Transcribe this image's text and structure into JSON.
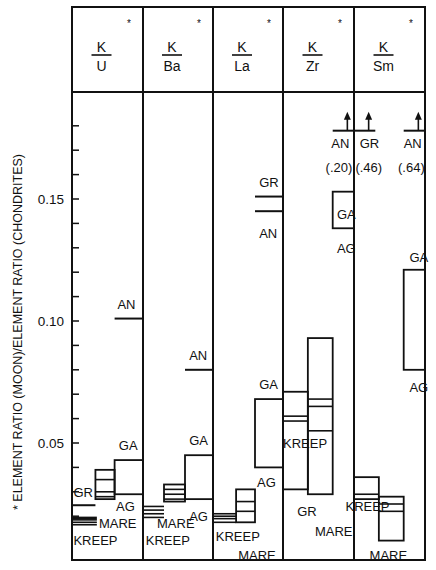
{
  "chart_data": {
    "type": "bar",
    "title": "",
    "ylabel": "* ELEMENT RATIO (MOON)/ELEMENT RATIO (CHONDRITES)",
    "xlabel": "",
    "ylim": [
      0,
      0.19
    ],
    "yticks": [
      {
        "value": 0.05,
        "label": "0.05"
      },
      {
        "value": 0.1,
        "label": "0.10"
      },
      {
        "value": 0.15,
        "label": "0.15"
      }
    ],
    "minor_tick_step": 0.01,
    "grid": false,
    "columns": [
      {
        "num": "K",
        "den": "U",
        "star": "*"
      },
      {
        "num": "K",
        "den": "Ba",
        "star": "*"
      },
      {
        "num": "K",
        "den": "La",
        "star": "*"
      },
      {
        "num": "K",
        "den": "Zr",
        "star": "*"
      },
      {
        "num": "K",
        "den": "Sm",
        "star": "*"
      }
    ],
    "series": [
      {
        "column": 0,
        "name": "KREEP",
        "kind": "band",
        "x": [
          0.0,
          0.35
        ],
        "lines": [
          0.0165,
          0.0175,
          0.0185,
          0.019,
          0.0195
        ]
      },
      {
        "column": 0,
        "name": "GR",
        "kind": "level",
        "x": [
          0.0,
          0.33
        ],
        "value": 0.0245
      },
      {
        "column": 0,
        "name": "MARE",
        "kind": "range",
        "x": [
          0.33,
          0.6
        ],
        "low": 0.027,
        "high": 0.039,
        "lines": [
          0.028,
          0.03,
          0.035
        ]
      },
      {
        "column": 0,
        "name": "AG/GA",
        "kind": "range",
        "x": [
          0.6,
          1.0
        ],
        "low": 0.029,
        "high": 0.043
      },
      {
        "column": 0,
        "name": "AN",
        "kind": "level",
        "x": [
          0.6,
          1.0
        ],
        "value": 0.101
      },
      {
        "column": 1,
        "name": "KREEP",
        "kind": "band",
        "x": [
          0.0,
          0.3
        ],
        "lines": [
          0.0195,
          0.021,
          0.0225,
          0.024
        ]
      },
      {
        "column": 1,
        "name": "MARE",
        "kind": "range",
        "x": [
          0.3,
          0.6
        ],
        "low": 0.026,
        "high": 0.033,
        "lines": [
          0.027,
          0.029,
          0.031
        ]
      },
      {
        "column": 1,
        "name": "AG/GA",
        "kind": "range",
        "x": [
          0.6,
          1.0
        ],
        "low": 0.027,
        "high": 0.045
      },
      {
        "column": 1,
        "name": "AN",
        "kind": "level",
        "x": [
          0.6,
          1.0
        ],
        "value": 0.08
      },
      {
        "column": 2,
        "name": "KREEP",
        "kind": "band",
        "x": [
          0.0,
          0.33
        ],
        "lines": [
          0.0175,
          0.019,
          0.02,
          0.021
        ]
      },
      {
        "column": 2,
        "name": "MARE",
        "kind": "range",
        "x": [
          0.33,
          0.6
        ],
        "low": 0.0175,
        "high": 0.031,
        "lines": [
          0.022,
          0.026
        ]
      },
      {
        "column": 2,
        "name": "AG/GA",
        "kind": "range",
        "x": [
          0.6,
          1.0
        ],
        "low": 0.04,
        "high": 0.068
      },
      {
        "column": 2,
        "name": "GR",
        "kind": "level",
        "x": [
          0.6,
          1.0
        ],
        "value": 0.151
      },
      {
        "column": 2,
        "name": "AN",
        "kind": "level",
        "x": [
          0.6,
          1.0
        ],
        "value": 0.145
      },
      {
        "column": 3,
        "name": "GR",
        "kind": "range",
        "x": [
          0.0,
          0.35
        ],
        "low": 0.031,
        "high": 0.071,
        "lines": [
          0.059,
          0.061
        ]
      },
      {
        "column": 3,
        "name": "KREEP/MARE",
        "kind": "range",
        "x": [
          0.35,
          0.7
        ],
        "low": 0.029,
        "high": 0.093,
        "lines": [
          0.055,
          0.065,
          0.068
        ]
      },
      {
        "column": 3,
        "name": "AG/GA",
        "kind": "range",
        "x": [
          0.7,
          1.0
        ],
        "low": 0.138,
        "high": 0.153
      },
      {
        "column": 3,
        "name": "AN (.20)",
        "kind": "offscale",
        "x": [
          0.7,
          1.0
        ],
        "value": 0.2
      },
      {
        "column": 4,
        "name": "GR (.46)",
        "kind": "offscale",
        "x": [
          0.0,
          0.3
        ],
        "value": 0.46
      },
      {
        "column": 4,
        "name": "KREEP",
        "kind": "range",
        "x": [
          0.0,
          0.35
        ],
        "low": 0.027,
        "high": 0.036,
        "lines": [
          0.029
        ]
      },
      {
        "column": 4,
        "name": "MARE",
        "kind": "range",
        "x": [
          0.35,
          0.7
        ],
        "low": 0.01,
        "high": 0.028,
        "lines": [
          0.025,
          0.022
        ]
      },
      {
        "column": 4,
        "name": "AG/GA",
        "kind": "range",
        "x": [
          0.7,
          1.0
        ],
        "low": 0.08,
        "high": 0.121
      },
      {
        "column": 4,
        "name": "AN (.64)",
        "kind": "offscale",
        "x": [
          0.7,
          1.0
        ],
        "value": 0.64
      }
    ],
    "annotations": [
      {
        "column": 0,
        "text": "GR",
        "x": 0.02,
        "y": 0.028
      },
      {
        "column": 0,
        "text": "MARE",
        "x": 0.38,
        "y": 0.015
      },
      {
        "column": 0,
        "text": "KREEP",
        "x": 0.02,
        "y": 0.008
      },
      {
        "column": 0,
        "text": "GA",
        "x": 0.66,
        "y": 0.047
      },
      {
        "column": 0,
        "text": "AG",
        "x": 0.62,
        "y": 0.022
      },
      {
        "column": 0,
        "text": "AN",
        "x": 0.64,
        "y": 0.105
      },
      {
        "column": 1,
        "text": "MARE",
        "x": 0.2,
        "y": 0.015
      },
      {
        "column": 1,
        "text": "KREEP",
        "x": 0.04,
        "y": 0.008
      },
      {
        "column": 1,
        "text": "GA",
        "x": 0.66,
        "y": 0.049
      },
      {
        "column": 1,
        "text": "AG",
        "x": 0.66,
        "y": 0.018
      },
      {
        "column": 1,
        "text": "AN",
        "x": 0.66,
        "y": 0.084
      },
      {
        "column": 2,
        "text": "KREEP",
        "x": 0.04,
        "y": 0.01
      },
      {
        "column": 2,
        "text": "MARE",
        "x": 0.36,
        "y": 0.002
      },
      {
        "column": 2,
        "text": "GA",
        "x": 0.66,
        "y": 0.072
      },
      {
        "column": 2,
        "text": "AG",
        "x": 0.63,
        "y": 0.032
      },
      {
        "column": 2,
        "text": "GR",
        "x": 0.66,
        "y": 0.155
      },
      {
        "column": 2,
        "text": "AN",
        "x": 0.66,
        "y": 0.134
      },
      {
        "column": 3,
        "text": "KREEP",
        "x": 0.0,
        "y": 0.048
      },
      {
        "column": 3,
        "text": "GR",
        "x": 0.2,
        "y": 0.02
      },
      {
        "column": 3,
        "text": "MARE",
        "x": 0.45,
        "y": 0.012
      },
      {
        "column": 3,
        "text": "GA",
        "x": 0.76,
        "y": 0.142
      },
      {
        "column": 3,
        "text": "AG",
        "x": 0.76,
        "y": 0.128
      },
      {
        "column": 3,
        "text": "AN",
        "x": 0.68,
        "y": 0.171
      },
      {
        "column": 3,
        "text": "(.20)",
        "x": 0.6,
        "y": 0.161
      },
      {
        "column": 4,
        "text": "GR",
        "x": 0.08,
        "y": 0.171
      },
      {
        "column": 4,
        "text": "(.46)",
        "x": 0.02,
        "y": 0.161
      },
      {
        "column": 4,
        "text": "AN",
        "x": 0.7,
        "y": 0.171
      },
      {
        "column": 4,
        "text": "(.64)",
        "x": 0.62,
        "y": 0.161
      },
      {
        "column": 4,
        "text": "GA",
        "x": 0.78,
        "y": 0.124
      },
      {
        "column": 4,
        "text": "AG",
        "x": 0.78,
        "y": 0.071
      },
      {
        "column": 4,
        "text": "KREEP",
        "x": -0.12,
        "y": 0.022
      },
      {
        "column": 4,
        "text": "MARE",
        "x": 0.22,
        "y": 0.002
      }
    ]
  }
}
